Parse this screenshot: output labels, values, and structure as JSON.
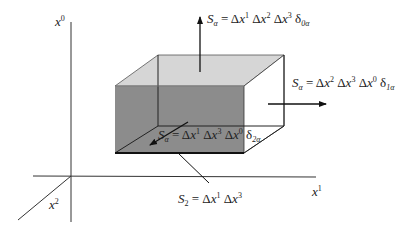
{
  "figure": {
    "axes": {
      "x0": {
        "var": "x",
        "sup": "0"
      },
      "x1": {
        "var": "x",
        "sup": "1"
      },
      "x2": {
        "var": "x",
        "sup": "2"
      }
    },
    "labels": {
      "top": {
        "lhs": "S",
        "lhs_sub": "α",
        "eq": " = Δ",
        "t1": "x",
        "s1": "1",
        "t2": " Δ",
        "t3": "x",
        "s2": "2",
        "t4": " Δ",
        "t5": "x",
        "s3": "3",
        "delta": " δ",
        "dsub": "0α"
      },
      "right": {
        "lhs": "S",
        "lhs_sub": "α",
        "eq": " = Δ",
        "t1": "x",
        "s1": "2",
        "t2": " Δ",
        "t3": "x",
        "s2": "3",
        "t4": " Δ",
        "t5": "x",
        "s3": "0",
        "delta": " δ",
        "dsub": "1α"
      },
      "front": {
        "lhs": "S",
        "lhs_sub": "α",
        "eq": " = Δ",
        "t1": "x",
        "s1": "1",
        "t2": " Δ",
        "t3": "x",
        "s2": "3",
        "t4": " Δ",
        "t5": "x",
        "s3": "0",
        "delta": " δ",
        "dsub": "2α"
      },
      "bottom": {
        "lhs": "S",
        "lhs_sub": "2",
        "eq": " = Δ",
        "t1": "x",
        "s1": "1",
        "t2": " Δ",
        "t3": "x",
        "s2": "3"
      }
    },
    "colors": {
      "front_face": "#8c8c8c",
      "top_face": "#d6d6d6",
      "right_face": "#ffffff",
      "lines": "#222222"
    }
  }
}
